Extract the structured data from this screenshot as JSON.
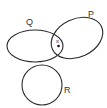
{
  "diagram": {
    "type": "venn",
    "sets": [
      {
        "id": "Q",
        "label": "Q",
        "shape": "ellipse",
        "cx": 35,
        "cy": 46,
        "rx": 28,
        "ry": 16,
        "rotate": 0,
        "label_x": 26,
        "label_y": 25
      },
      {
        "id": "P",
        "label": "P",
        "shape": "ellipse",
        "cx": 77,
        "cy": 38,
        "rx": 27,
        "ry": 19,
        "rotate": -25,
        "label_x": 88,
        "label_y": 17
      },
      {
        "id": "R",
        "label": "R",
        "shape": "circle",
        "cx": 42,
        "cy": 85,
        "r": 20,
        "label_x": 64,
        "label_y": 93
      }
    ],
    "marks": [
      {
        "symbol": "x",
        "x": 58,
        "y": 42
      },
      {
        "symbol": "dot",
        "x": 58.5,
        "y": 46
      }
    ],
    "colors": {
      "stroke": "#2a2a2a",
      "background": "#ffffff"
    }
  }
}
